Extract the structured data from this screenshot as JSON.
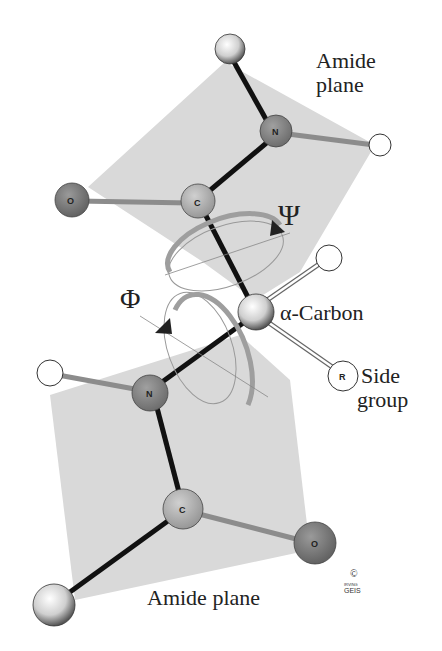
{
  "diagram": {
    "labels": {
      "amide_plane_top_line1": "Amide",
      "amide_plane_top_line2": "plane",
      "psi": "Ψ",
      "phi": "Φ",
      "alpha_carbon": "α-Carbon",
      "side_group_line1": "Side",
      "side_group_line2": "group",
      "amide_plane_bottom": "Amide plane",
      "copyright": "©",
      "signature_line1": "IRVING",
      "signature_line2": "GEIS"
    },
    "atoms": {
      "oxygen_top": "O",
      "carbon_top": "C",
      "nitrogen_top": "N",
      "nitrogen_bottom": "N",
      "carbon_bottom": "C",
      "oxygen_bottom": "O",
      "r_group": "R"
    },
    "colors": {
      "plane": "#d9d9d9",
      "oxygen": "#7a7a7a",
      "nitrogen": "#8a8a8a",
      "carbon": "#b4b4b4",
      "bond_dark": "#111111",
      "bond_double": "#8c8c8c",
      "ring": "#a8a8a8"
    }
  }
}
